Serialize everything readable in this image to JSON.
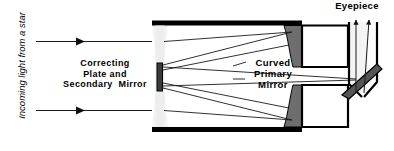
{
  "diagram": {
    "labels": {
      "incoming": "Incoming light from a star",
      "correcting_plate": "Correcting\nPlate and\nSecondary  Mirror",
      "primary_mirror": "Curved\nPrimary\nMirror",
      "eyepiece": "Eyepiece"
    },
    "colors": {
      "background": "#ffffff",
      "tube_wall": "#000000",
      "primary_mirror_fill": "#6e6e6e",
      "secondary_mirror_fill": "#3a3a3a",
      "correcting_plate_fill": "#e8e8e8",
      "light_beam_fill": "#f0f0f0",
      "ray_stroke": "#1a1a1a",
      "diagonal_mirror_fill": "#555555"
    },
    "parts": [
      {
        "name": "incoming-ray-upper",
        "type": "ray",
        "direction": "right"
      },
      {
        "name": "incoming-ray-lower",
        "type": "ray",
        "direction": "right"
      },
      {
        "name": "correcting-plate",
        "type": "optical-element"
      },
      {
        "name": "secondary-mirror",
        "type": "mirror"
      },
      {
        "name": "curved-primary-mirror-upper",
        "type": "mirror"
      },
      {
        "name": "curved-primary-mirror-lower",
        "type": "mirror"
      },
      {
        "name": "diagonal-flat-mirror",
        "type": "mirror"
      },
      {
        "name": "eyepiece-tube",
        "type": "housing"
      },
      {
        "name": "exit-ray-left",
        "type": "ray",
        "direction": "up"
      },
      {
        "name": "exit-ray-right",
        "type": "ray",
        "direction": "up"
      }
    ]
  }
}
